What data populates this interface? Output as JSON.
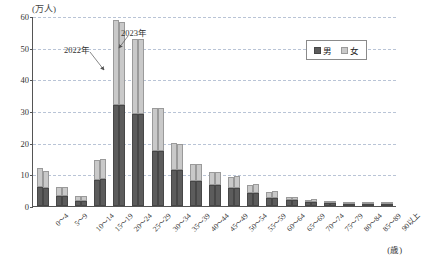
{
  "chart_data": {
    "type": "bar",
    "title": "",
    "subtitle": "",
    "unit_label": "(万人)",
    "xlabel": "(歳)",
    "ylabel": "",
    "ylim": [
      0,
      60
    ],
    "ytick_values": [
      0,
      10,
      20,
      30,
      40,
      50,
      60
    ],
    "ytick_labels": [
      "0",
      "10",
      "20",
      "30",
      "40",
      "50",
      "60"
    ],
    "grid": true,
    "legend_position": "top-right",
    "legend": [
      "男",
      "女"
    ],
    "stacked": true,
    "grouped_by": "year",
    "categories": [
      "0〜4",
      "5〜9",
      "10〜14",
      "15〜19",
      "20〜24",
      "25〜29",
      "30〜34",
      "35〜39",
      "40〜44",
      "45〜49",
      "50〜54",
      "55〜59",
      "60〜64",
      "65〜69",
      "70〜74",
      "75〜79",
      "80〜84",
      "85〜89",
      "90以上"
    ],
    "series": [
      {
        "name": "2022年 男",
        "year": "2022",
        "sex": "男",
        "color": "#5c5c5c",
        "values": [
          6.1,
          3.1,
          1.6,
          8.3,
          32.0,
          29.0,
          17.4,
          11.5,
          7.9,
          6.7,
          5.6,
          4.2,
          2.6,
          1.9,
          1.2,
          0.8,
          0.7,
          0.6,
          0.4
        ]
      },
      {
        "name": "2022年 女",
        "year": "2022",
        "sex": "女",
        "color": "#c9c9c9",
        "values": [
          5.8,
          2.8,
          1.5,
          6.1,
          26.8,
          23.6,
          13.6,
          8.5,
          5.3,
          4.2,
          3.5,
          2.3,
          1.7,
          0.8,
          0.8,
          0.7,
          0.6,
          0.6,
          0.4
        ]
      },
      {
        "name": "2023年 男",
        "year": "2023",
        "sex": "男",
        "color": "#5c5c5c",
        "values": [
          5.6,
          3.1,
          1.6,
          8.5,
          32.0,
          29.0,
          17.4,
          11.5,
          7.9,
          6.7,
          5.6,
          4.2,
          2.6,
          1.9,
          1.2,
          0.8,
          0.7,
          0.6,
          0.4
        ]
      },
      {
        "name": "2023年 女",
        "year": "2023",
        "sex": "女",
        "color": "#c9c9c9",
        "values": [
          5.4,
          2.9,
          1.5,
          6.2,
          26.2,
          23.6,
          13.6,
          8.0,
          5.4,
          4.0,
          3.9,
          2.6,
          2.0,
          1.0,
          1.0,
          0.8,
          0.7,
          0.6,
          0.4
        ]
      }
    ],
    "totals_2022": [
      11.9,
      5.9,
      3.1,
      14.4,
      58.8,
      52.6,
      31.0,
      20.0,
      13.2,
      10.9,
      9.1,
      6.5,
      4.3,
      2.7,
      2.0,
      1.5,
      1.3,
      1.2,
      0.8
    ],
    "totals_2023": [
      11.0,
      6.0,
      3.1,
      14.7,
      58.2,
      52.6,
      31.0,
      19.5,
      13.3,
      10.7,
      9.5,
      6.8,
      4.6,
      2.9,
      2.2,
      1.6,
      1.4,
      1.2,
      0.8
    ],
    "annotations": [
      {
        "text": "2022年",
        "target_category": "20〜24"
      },
      {
        "text": "2023年",
        "target_category": "20〜24"
      }
    ]
  },
  "colors": {
    "male": "#5c5c5c",
    "female": "#c9c9c9",
    "grid": "#b9c4d6",
    "axis": "#555555"
  }
}
